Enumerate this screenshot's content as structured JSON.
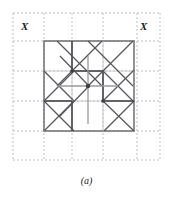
{
  "figure": {
    "caption": "(a)",
    "labels": {
      "x_left": "X",
      "x_right": "X"
    },
    "colors": {
      "background": "#ffffff",
      "grid_dashed": "#b9b9bd",
      "cell_outline": "#6f6f74",
      "symmetry_line": "#58585c",
      "text": "#1a1a1a"
    },
    "geometry": {
      "canvas": {
        "width": 173,
        "height": 200
      },
      "dashed_grid": {
        "x_positions": [
          13,
          44,
          72,
          103,
          137,
          160
        ],
        "y_positions": [
          13,
          41,
          71,
          101,
          131,
          160
        ],
        "dash_pattern": "2 2",
        "stroke_width": 0.9
      },
      "unit_cell": {
        "x": 44,
        "y": 41,
        "width": 90,
        "height": 90
      },
      "inner_grid": {
        "vertical_x": [
          72,
          103
        ],
        "horizontal_y": [
          71,
          101
        ]
      },
      "bold_segments": [
        {
          "x1": 72,
          "y1": 41,
          "x2": 72,
          "y2": 71,
          "w": 1.7
        },
        {
          "x1": 72,
          "y1": 101,
          "x2": 72,
          "y2": 131,
          "w": 1.7
        },
        {
          "x1": 103,
          "y1": 71,
          "x2": 103,
          "y2": 101,
          "w": 1.7
        },
        {
          "x1": 72,
          "y1": 71,
          "x2": 103,
          "y2": 71,
          "w": 1.7
        },
        {
          "x1": 103,
          "y1": 101,
          "x2": 134,
          "y2": 101,
          "w": 1.7
        },
        {
          "x1": 44,
          "y1": 101,
          "x2": 72,
          "y2": 101,
          "w": 1.7
        }
      ],
      "mirror_lines": [
        {
          "x1": 88,
          "y1": 56,
          "x2": 88,
          "y2": 124,
          "w": 1.3
        },
        {
          "x1": 57,
          "y1": 86,
          "x2": 118,
          "y2": 86,
          "w": 1.3
        }
      ],
      "diagonals_down": [
        {
          "x1": 57,
          "y1": 41,
          "x2": 102,
          "y2": 86
        },
        {
          "x1": 88,
          "y1": 41,
          "x2": 133,
          "y2": 86
        },
        {
          "x1": 44,
          "y1": 71,
          "x2": 74,
          "y2": 101
        },
        {
          "x1": 44,
          "y1": 101,
          "x2": 74,
          "y2": 131
        },
        {
          "x1": 103,
          "y1": 71,
          "x2": 134,
          "y2": 102
        },
        {
          "x1": 60,
          "y1": 56,
          "x2": 89,
          "y2": 86
        },
        {
          "x1": 104,
          "y1": 102,
          "x2": 134,
          "y2": 131
        }
      ],
      "diagonals_up": [
        {
          "x1": 57,
          "y1": 86,
          "x2": 102,
          "y2": 41
        },
        {
          "x1": 88,
          "y1": 86,
          "x2": 133,
          "y2": 41
        },
        {
          "x1": 44,
          "y1": 101,
          "x2": 74,
          "y2": 71
        },
        {
          "x1": 44,
          "y1": 131,
          "x2": 74,
          "y2": 101
        },
        {
          "x1": 103,
          "y1": 101,
          "x2": 134,
          "y2": 70
        },
        {
          "x1": 104,
          "y1": 131,
          "x2": 134,
          "y2": 101
        },
        {
          "x1": 60,
          "y1": 116,
          "x2": 89,
          "y2": 86
        }
      ],
      "nodes": [
        {
          "cx": 72,
          "cy": 71,
          "r": 1.8
        },
        {
          "cx": 88,
          "cy": 86,
          "r": 2.2
        },
        {
          "cx": 103,
          "cy": 101,
          "r": 1.8
        }
      ]
    }
  }
}
